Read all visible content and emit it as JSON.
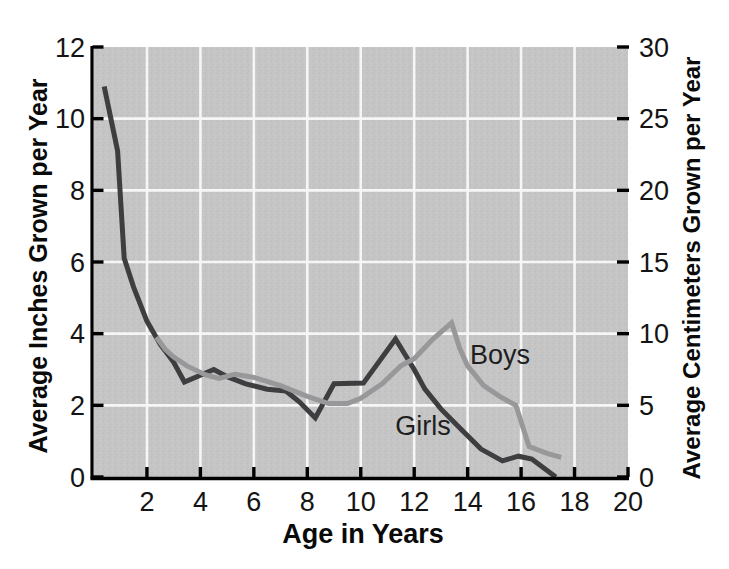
{
  "chart_data": {
    "type": "line",
    "title": "",
    "xlabel": "Age in Years",
    "ylabel_left": "Average Inches Grown per Year",
    "ylabel_right": "Average Centimeters Grown per Year",
    "xlim": [
      0,
      20
    ],
    "ylim_left": [
      0,
      12
    ],
    "ylim_right": [
      0,
      30
    ],
    "x_ticks": [
      2,
      4,
      6,
      8,
      10,
      12,
      14,
      16,
      18,
      20
    ],
    "y_ticks_left": [
      0,
      2,
      4,
      6,
      8,
      10,
      12
    ],
    "y_ticks_right": [
      0,
      5,
      10,
      15,
      20,
      25,
      30
    ],
    "grid": true,
    "legend_position": "inline-labels",
    "plot_bg_color": "#c5c5c5",
    "grid_color": "#f6f6f6",
    "axis_color": "#000000",
    "series": [
      {
        "name": "Boys",
        "color": "#98989b",
        "units": "inches per year vs age in years",
        "points": [
          [
            2.35,
            3.9
          ],
          [
            2.7,
            3.55
          ],
          [
            3.0,
            3.35
          ],
          [
            3.5,
            3.1
          ],
          [
            4.2,
            2.85
          ],
          [
            4.7,
            2.75
          ],
          [
            5.3,
            2.87
          ],
          [
            6.0,
            2.78
          ],
          [
            7.0,
            2.55
          ],
          [
            8.0,
            2.25
          ],
          [
            8.8,
            2.05
          ],
          [
            9.5,
            2.05
          ],
          [
            10.0,
            2.2
          ],
          [
            10.8,
            2.6
          ],
          [
            11.5,
            3.1
          ],
          [
            12.0,
            3.3
          ],
          [
            12.7,
            3.85
          ],
          [
            13.4,
            4.3
          ],
          [
            13.7,
            3.6
          ],
          [
            14.0,
            3.1
          ],
          [
            14.6,
            2.55
          ],
          [
            15.2,
            2.25
          ],
          [
            15.8,
            2.0
          ],
          [
            16.3,
            0.85
          ],
          [
            17.0,
            0.65
          ],
          [
            17.5,
            0.55
          ]
        ]
      },
      {
        "name": "Girls",
        "color": "#3e3e40",
        "units": "inches per year vs age in years",
        "points": [
          [
            0.4,
            10.9
          ],
          [
            0.9,
            9.1
          ],
          [
            1.15,
            6.1
          ],
          [
            1.5,
            5.3
          ],
          [
            2.0,
            4.35
          ],
          [
            2.5,
            3.7
          ],
          [
            3.0,
            3.2
          ],
          [
            3.4,
            2.65
          ],
          [
            4.5,
            3.0
          ],
          [
            5.0,
            2.8
          ],
          [
            5.7,
            2.6
          ],
          [
            6.5,
            2.45
          ],
          [
            7.2,
            2.4
          ],
          [
            7.7,
            2.1
          ],
          [
            8.3,
            1.65
          ],
          [
            9.0,
            2.6
          ],
          [
            10.1,
            2.62
          ],
          [
            11.3,
            3.85
          ],
          [
            12.0,
            3.0
          ],
          [
            12.4,
            2.45
          ],
          [
            13.0,
            1.9
          ],
          [
            13.8,
            1.3
          ],
          [
            14.5,
            0.78
          ],
          [
            15.3,
            0.45
          ],
          [
            15.9,
            0.58
          ],
          [
            16.4,
            0.5
          ],
          [
            17.3,
            0.0
          ]
        ]
      }
    ]
  }
}
